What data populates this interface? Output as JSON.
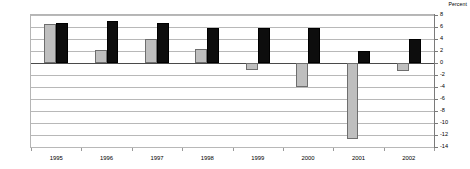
{
  "chart_data": {
    "type": "bar",
    "title": "",
    "subtitle": "",
    "xlabel": "",
    "ylabel": "Percent",
    "unit_caption": "Percent",
    "categories": [
      "1995",
      "1996",
      "1997",
      "1998",
      "1999",
      "2000",
      "2001",
      "2002"
    ],
    "series": [
      {
        "name": "series-a",
        "color": "#bfbfbf",
        "values": [
          6.5,
          2.2,
          4.0,
          2.4,
          -1.1,
          -4.0,
          -12.7,
          -1.3
        ]
      },
      {
        "name": "series-b",
        "color": "#0d0d0d",
        "values": [
          6.6,
          7.0,
          6.6,
          5.8,
          5.8,
          5.8,
          2.0,
          4.0
        ]
      }
    ],
    "ylim": [
      -14,
      8
    ],
    "yticks": [
      8,
      6,
      4,
      2,
      0,
      -2,
      -4,
      -6,
      -8,
      -10,
      -12,
      -14
    ],
    "ytick_labels": [
      "8",
      "6",
      "4",
      "2",
      "0",
      "-2",
      "-4",
      "-6",
      "-8",
      "-10",
      "-12",
      "-14"
    ],
    "grid": true,
    "grid_axis": "y",
    "legend": "none",
    "legend_position": "none",
    "zero_line": 0,
    "value_axis_position": "right",
    "annotations": []
  }
}
